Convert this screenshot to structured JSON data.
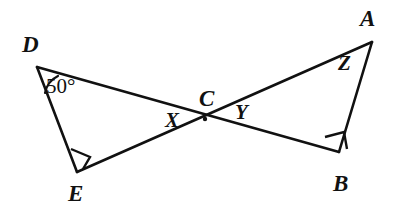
{
  "figure": {
    "type": "geometry-diagram",
    "background_color": "#ffffff",
    "stroke_color": "#111111",
    "width": 403,
    "height": 219
  },
  "points": {
    "D": {
      "label": "D",
      "x": 37,
      "y": 67
    },
    "E": {
      "label": "E",
      "x": 77,
      "y": 172
    },
    "A": {
      "label": "A",
      "x": 372,
      "y": 42
    },
    "B": {
      "label": "B",
      "x": 339,
      "y": 152
    },
    "C": {
      "label": "C",
      "x": 205,
      "y": 119
    }
  },
  "segments": [
    {
      "name": "D-B",
      "from": "D",
      "to": "B"
    },
    {
      "name": "E-A",
      "from": "E",
      "to": "A"
    },
    {
      "name": "D-E",
      "from": "D",
      "to": "E"
    },
    {
      "name": "A-B",
      "from": "A",
      "to": "B"
    }
  ],
  "angle_labels": {
    "D": "50°",
    "X": "X",
    "Y": "Y",
    "Z": "Z",
    "C": "C"
  },
  "right_angles": [
    {
      "at": "E",
      "marker": "square"
    },
    {
      "at": "B",
      "marker": "square"
    }
  ],
  "arcs": [
    {
      "at": "D",
      "note": "angle arc for 50 degree marking"
    }
  ]
}
